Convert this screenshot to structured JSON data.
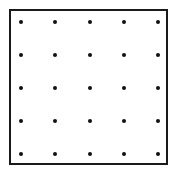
{
  "diagram": {
    "type": "dot-grid",
    "rows": 5,
    "cols": 5,
    "colors": {
      "frame": "#1a1a1a",
      "dot": "#111111",
      "background": "#ffffff"
    },
    "dot_x": [
      21,
      55,
      90,
      124,
      158
    ],
    "dot_y": [
      22,
      55,
      88,
      121,
      154
    ]
  }
}
